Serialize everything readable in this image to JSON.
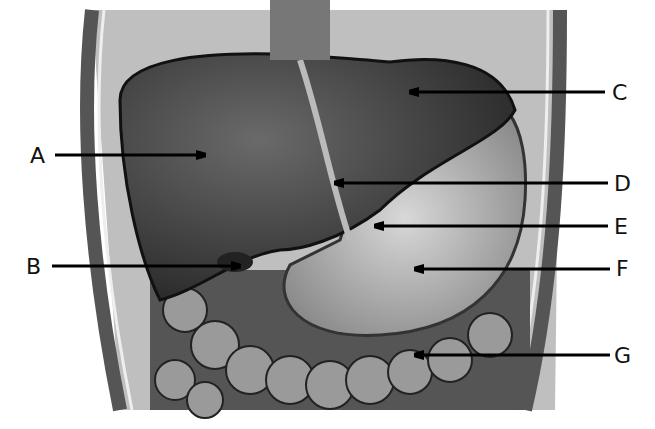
{
  "figure": {
    "labels": [
      {
        "id": "A",
        "text": "A",
        "x": 40,
        "y": 157,
        "arrow": {
          "x1": 55,
          "y1": 155,
          "x2": 205,
          "y2": 155
        }
      },
      {
        "id": "B",
        "text": "B",
        "x": 28,
        "y": 270,
        "arrow": {
          "x1": 52,
          "y1": 266,
          "x2": 240,
          "y2": 266
        }
      },
      {
        "id": "C",
        "text": "C",
        "x": 612,
        "y": 94,
        "arrow": {
          "x1": 605,
          "y1": 92,
          "x2": 410,
          "y2": 92
        }
      },
      {
        "id": "D",
        "text": "D",
        "x": 615,
        "y": 186,
        "arrow": {
          "x1": 608,
          "y1": 183,
          "x2": 335,
          "y2": 183
        }
      },
      {
        "id": "E",
        "text": "E",
        "x": 615,
        "y": 229,
        "arrow": {
          "x1": 608,
          "y1": 226,
          "x2": 375,
          "y2": 226
        }
      },
      {
        "id": "F",
        "text": "F",
        "x": 617,
        "y": 271,
        "arrow": {
          "x1": 610,
          "y1": 269,
          "x2": 415,
          "y2": 269
        }
      },
      {
        "id": "G",
        "text": "G",
        "x": 617,
        "y": 357,
        "arrow": {
          "x1": 610,
          "y1": 355,
          "x2": 415,
          "y2": 355
        }
      }
    ]
  }
}
